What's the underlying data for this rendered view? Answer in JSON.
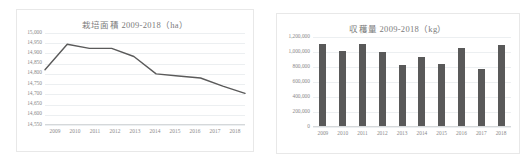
{
  "page": {
    "background_color": "#ffffff",
    "card_border_color": "#e8e8e8"
  },
  "charts": {
    "left": {
      "title": "栽培面積 2009-2018（ha）",
      "axis_label_color": "#8a8a8a",
      "line_color": "#5a5a5a",
      "grid_color": "#eceff1"
    },
    "right": {
      "title": "収穫量 2009-2018（kg）",
      "axis_label_color": "#8a8a8a",
      "bar_color": "#595959",
      "grid_color": "#eceff1"
    }
  },
  "chart_data": [
    {
      "type": "line",
      "title": "栽培面積 2009-2018（ha）",
      "xlabel": "",
      "ylabel": "",
      "categories": [
        "2009",
        "2010",
        "2011",
        "2012",
        "2013",
        "2014",
        "2015",
        "2016",
        "2017",
        "2018"
      ],
      "values": [
        14820,
        14945,
        14925,
        14925,
        14885,
        14800,
        14790,
        14780,
        14740,
        14705
      ],
      "ylim": [
        14550,
        15000
      ],
      "ytick_step": 50,
      "ytick_labels": [
        "15,000",
        "14,950",
        "14,900",
        "14,850",
        "14,800",
        "14,750",
        "14,700",
        "14,650",
        "14,600",
        "14,550"
      ],
      "ytick_values": [
        15000,
        14950,
        14900,
        14850,
        14800,
        14750,
        14700,
        14650,
        14600,
        14550
      ],
      "grid": true,
      "legend": "none",
      "unit": "ha"
    },
    {
      "type": "bar",
      "title": "収穫量 2009-2018（kg）",
      "xlabel": "",
      "ylabel": "",
      "categories": [
        "2009",
        "2010",
        "2011",
        "2012",
        "2013",
        "2014",
        "2015",
        "2016",
        "2017",
        "2018"
      ],
      "values": [
        1105000,
        1020000,
        1110000,
        995000,
        830000,
        930000,
        840000,
        1060000,
        780000,
        1090000
      ],
      "ylim": [
        0,
        1200000
      ],
      "ytick_step": 200000,
      "ytick_labels": [
        "1,200,000",
        "1,000,000",
        "800,000",
        "600,000",
        "400,000",
        "200,000",
        "0"
      ],
      "ytick_values": [
        1200000,
        1000000,
        800000,
        600000,
        400000,
        200000,
        0
      ],
      "grid": true,
      "legend": "none",
      "unit": "kg"
    }
  ]
}
